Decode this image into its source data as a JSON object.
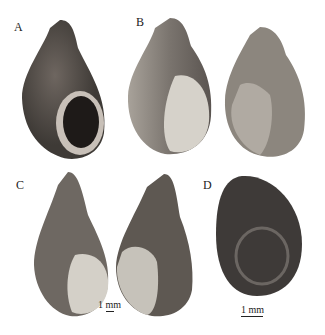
{
  "figure": {
    "panels": [
      {
        "label": "A",
        "description": "gastropod shell, apertural view, dark brown"
      },
      {
        "label": "B",
        "description": "gastropod shell, apertural and abapertural views"
      },
      {
        "label": "C",
        "description": "elongated gastropod shell, apertural and abapertural views"
      },
      {
        "label": "D",
        "description": "operculum, dark oval"
      }
    ],
    "scale_bars": [
      {
        "panel": "C",
        "text": "1 mm"
      },
      {
        "panel": "D",
        "text": "1 mm"
      }
    ],
    "colors": {
      "shell_dark": "#4a4440",
      "shell_mid": "#8a847c",
      "shell_light": "#d8d4cc",
      "operculum": "#3a3634"
    }
  }
}
